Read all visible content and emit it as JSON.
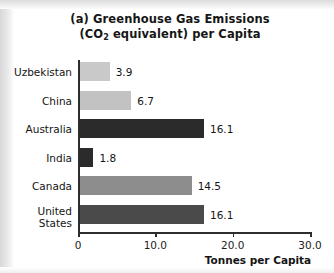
{
  "chart_data": {
    "type": "bar",
    "orientation": "horizontal",
    "title": "(a) Greenhouse Gas Emissions (CO2 equivalent) per Capita",
    "title_line1": "(a) Greenhouse Gas Emissions",
    "title_line2_pre": "(CO",
    "title_line2_sub": "2",
    "title_line2_post": " equivalent) per Capita",
    "xlabel": "Tonnes per Capita",
    "ylabel": "",
    "xlim": [
      0,
      30
    ],
    "grid": false,
    "legend": "none",
    "xticks": [
      "0",
      "10.0",
      "20.0",
      "30.0"
    ],
    "xtick_values": [
      0,
      10,
      20,
      30
    ],
    "categories": [
      "Uzbekistan",
      "China",
      "Australia",
      "India",
      "Canada",
      "United States"
    ],
    "values": [
      3.9,
      6.7,
      16.1,
      1.8,
      14.5,
      16.1
    ],
    "value_labels": [
      "3.9",
      "6.7",
      "16.1",
      "1.8",
      "14.5",
      "16.1"
    ],
    "bar_colors": [
      "#c9c9c9",
      "#c2c2c2",
      "#2b2b2b",
      "#2b2b2b",
      "#8d8d8d",
      "#4a4a4a"
    ],
    "bars": [
      {
        "category": "Uzbekistan",
        "category_line1": "Uzbekistan",
        "category_line2": "",
        "value": 3.9,
        "value_label": "3.9",
        "color": "#c9c9c9"
      },
      {
        "category": "China",
        "category_line1": "China",
        "category_line2": "",
        "value": 6.7,
        "value_label": "6.7",
        "color": "#c2c2c2"
      },
      {
        "category": "Australia",
        "category_line1": "Australia",
        "category_line2": "",
        "value": 16.1,
        "value_label": "16.1",
        "color": "#2b2b2b"
      },
      {
        "category": "India",
        "category_line1": "India",
        "category_line2": "",
        "value": 1.8,
        "value_label": "1.8",
        "color": "#2b2b2b"
      },
      {
        "category": "Canada",
        "category_line1": "Canada",
        "category_line2": "",
        "value": 14.5,
        "value_label": "14.5",
        "color": "#8d8d8d"
      },
      {
        "category": "United States",
        "category_line1": "United",
        "category_line2": "States",
        "value": 16.1,
        "value_label": "16.1",
        "color": "#4a4a4a"
      }
    ]
  }
}
